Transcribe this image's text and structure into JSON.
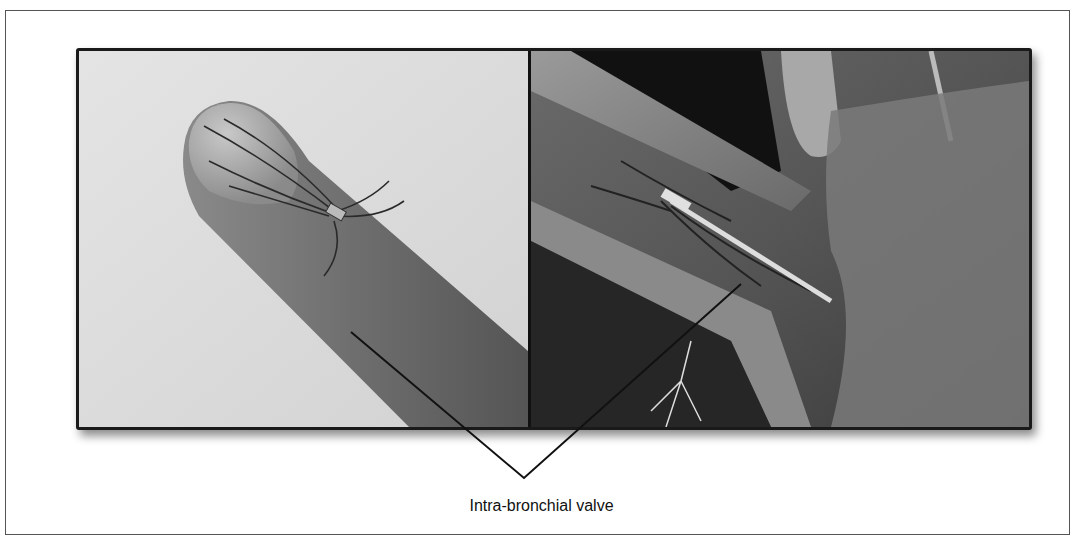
{
  "figure": {
    "panels": [
      {
        "id": "left",
        "description": "Intra-bronchial valve on a gloved fingertip (photograph)"
      },
      {
        "id": "right",
        "description": "Illustration of intra-bronchial valve deployed in airway"
      }
    ],
    "caption": "Intra-bronchial valve",
    "colors": {
      "frame": "#555555",
      "panel_border": "#1a1a1a",
      "leader_line": "#111111"
    }
  }
}
